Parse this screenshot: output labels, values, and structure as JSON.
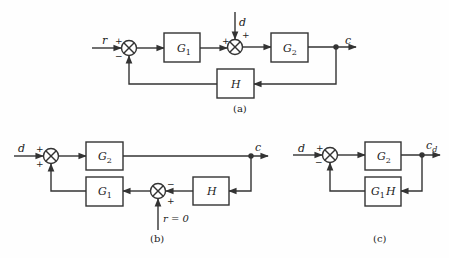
{
  "diagrams": [
    {
      "id": "a",
      "caption": "(a)",
      "input_label": "r",
      "disturbance_label": "d",
      "output_label": "c",
      "blocks": [
        {
          "name": "G1",
          "base": "G",
          "sub": "1"
        },
        {
          "name": "G2",
          "base": "G",
          "sub": "2"
        },
        {
          "name": "H",
          "base": "H",
          "sub": ""
        }
      ],
      "summer1_signs": {
        "top_left": "+",
        "bottom": "−"
      },
      "summer2_signs": {
        "left": "+",
        "top": "+"
      }
    },
    {
      "id": "b",
      "caption": "(b)",
      "input_label": "d",
      "output_label": "c",
      "reference_label": "r = 0",
      "blocks": [
        {
          "name": "G2",
          "base": "G",
          "sub": "2"
        },
        {
          "name": "G1",
          "base": "G",
          "sub": "1"
        },
        {
          "name": "H",
          "base": "H",
          "sub": ""
        }
      ],
      "summer1_signs": {
        "top": "+",
        "bottom": "+"
      },
      "summer2_signs": {
        "right_top": "−",
        "bottom_right": "+"
      }
    },
    {
      "id": "c",
      "caption": "(c)",
      "input_label": "d",
      "output_label": "c",
      "output_sub": "d",
      "blocks": [
        {
          "name": "G2",
          "base": "G",
          "sub": "2"
        },
        {
          "name": "G1H",
          "base": "G",
          "sub": "1",
          "suffix": "H"
        }
      ],
      "summer1_signs": {
        "top": "+",
        "bottom": "−"
      }
    }
  ]
}
